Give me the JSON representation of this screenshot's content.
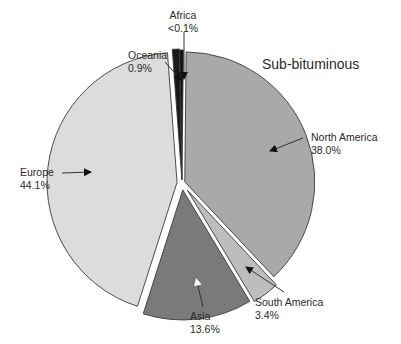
{
  "chart_data": {
    "type": "pie",
    "title": "Sub-bituminous",
    "categories": [
      "North America",
      "South America",
      "Asia",
      "Europe",
      "Oceania",
      "Africa"
    ],
    "values": [
      38.0,
      3.4,
      13.6,
      44.1,
      0.9,
      0.1
    ],
    "value_labels": [
      "38.0%",
      "3.4%",
      "13.6%",
      "44.1%",
      "0.9%",
      "<0.1%"
    ],
    "colors": [
      "#a9a9a9",
      "#bdbdbd",
      "#7a7a7a",
      "#dcdcdc",
      "#1a1a1a",
      "#111111"
    ],
    "exploded": true,
    "legend": "none (callout labels)"
  },
  "labels": {
    "north_america": {
      "name": "North America",
      "value": "38.0%"
    },
    "south_america": {
      "name": "South America",
      "value": "3.4%"
    },
    "asia": {
      "name": "Asia",
      "value": "13.6%"
    },
    "europe": {
      "name": "Europe",
      "value": "44.1%"
    },
    "oceania": {
      "name": "Oceania",
      "value": "0.9%"
    },
    "africa": {
      "name": "Africa",
      "value": "<0.1%"
    }
  }
}
